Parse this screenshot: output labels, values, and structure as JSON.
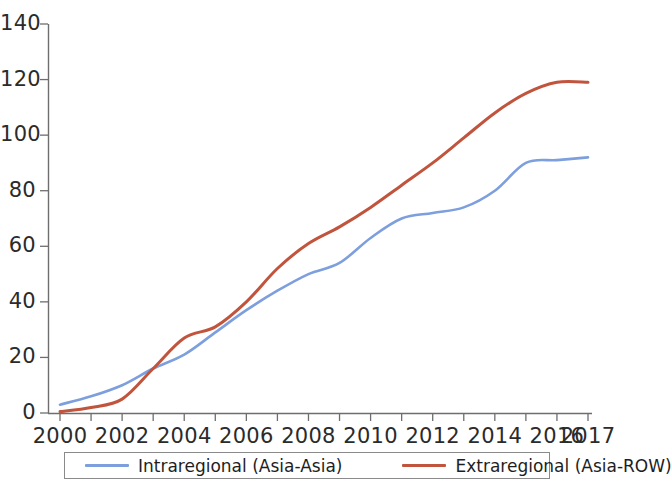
{
  "chart_data": {
    "type": "line",
    "title": "",
    "subtitle": "",
    "xlabel": "",
    "ylabel": "",
    "xlim": [
      2000,
      2017
    ],
    "ylim": [
      0,
      140
    ],
    "grid": false,
    "legend_position": "bottom",
    "x": [
      2000,
      2001,
      2002,
      2003,
      2004,
      2005,
      2006,
      2007,
      2008,
      2009,
      2010,
      2011,
      2012,
      2013,
      2014,
      2015,
      2016,
      2017
    ],
    "x_tick_labels": [
      "2000",
      "2002",
      "2004",
      "2006",
      "2008",
      "2010",
      "2012",
      "2014",
      "2016",
      "2017"
    ],
    "x_ticks": [
      2000,
      2002,
      2004,
      2006,
      2008,
      2010,
      2012,
      2014,
      2016,
      2017
    ],
    "y_tick_labels": [
      "0",
      "20",
      "40",
      "60",
      "80",
      "100",
      "120",
      "140"
    ],
    "y_ticks": [
      0,
      20,
      40,
      60,
      80,
      100,
      120,
      140
    ],
    "series": [
      {
        "name": "Intraregional (Asia-Asia)",
        "color": "#7d9fdd",
        "values": [
          3,
          6,
          10,
          16,
          21,
          29,
          37,
          44,
          50,
          54,
          63,
          70,
          72,
          74,
          80,
          90,
          91,
          92
        ]
      },
      {
        "name": "Extraregional (Asia-ROW)",
        "color": "#c0543d",
        "values": [
          0.5,
          2,
          5,
          16,
          27,
          31,
          40,
          52,
          61,
          67,
          74,
          82,
          90,
          99,
          108,
          115,
          119,
          119
        ]
      }
    ]
  },
  "axes": {
    "y_labels": [
      "140",
      "120",
      "100",
      "80",
      "60",
      "40",
      "20",
      "0"
    ],
    "x_labels": [
      "2000",
      "2002",
      "2004",
      "2006",
      "2008",
      "2010",
      "2012",
      "2014",
      "2016",
      "2017"
    ]
  },
  "legend": {
    "items": [
      {
        "label": "Intraregional (Asia-Asia)",
        "color": "#7d9fdd"
      },
      {
        "label": "Extraregional (Asia-ROW)",
        "color": "#c0543d"
      }
    ]
  }
}
